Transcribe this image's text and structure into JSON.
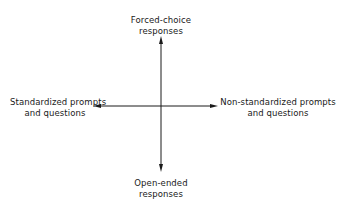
{
  "diagram": {
    "type": "two-axis quadrant",
    "axes": {
      "vertical": {
        "top": {
          "line1": "Forced-choice",
          "line2": "responses"
        },
        "bottom": {
          "line1": "Open-ended",
          "line2": "responses"
        }
      },
      "horizontal": {
        "left": {
          "line1": "Standardized prompts",
          "line2": "and questions"
        },
        "right": {
          "line1": "Non-standardized prompts",
          "line2": "and questions"
        }
      }
    },
    "colors": {
      "line": "#1a1a1a",
      "background": "#ffffff"
    }
  }
}
